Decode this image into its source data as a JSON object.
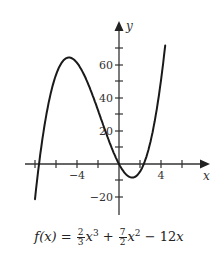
{
  "chart_data": {
    "type": "line",
    "title": "",
    "function": "f(x) = (2/3)x^3 + (7/2)x^2 - 12x",
    "caption": "f(x) = 2/3 x^3 + 7/2 x^2 − 12x",
    "xlabel": "x",
    "ylabel": "y",
    "xlim": [
      -9.5,
      8.5
    ],
    "ylim": [
      -25,
      85
    ],
    "x_ticks": [
      -8,
      -6,
      -4,
      -2,
      2,
      4,
      6
    ],
    "x_tick_labels": [
      {
        "value": -4,
        "label": "−4"
      },
      {
        "value": 4,
        "label": "4"
      }
    ],
    "y_ticks": [
      -20,
      -10,
      10,
      20,
      30,
      40,
      50,
      60,
      70
    ],
    "y_tick_labels": [
      {
        "value": -20,
        "label": "−20"
      },
      {
        "value": 20,
        "label": "20"
      },
      {
        "value": 40,
        "label": "40"
      },
      {
        "value": 60,
        "label": "60"
      }
    ],
    "grid": false,
    "series": [
      {
        "name": "f(x)",
        "x": [
          -8,
          -7.5,
          -7,
          -6.5,
          -6,
          -5.5,
          -5,
          -4.5,
          -4,
          -3.5,
          -3,
          -2.5,
          -2,
          -1.5,
          -1,
          -0.5,
          0,
          0.5,
          1,
          1.5,
          2,
          2.5,
          3,
          3.5,
          4,
          4.4
        ],
        "values": [
          -21.33,
          3.94,
          24.17,
          39.77,
          54,
          62.79,
          62.92,
          64.13,
          61.33,
          55.04,
          45.5,
          32.71,
          26.67,
          15.62,
          3.83,
          2.79,
          0,
          -4.04,
          -7.83,
          -10.0,
          -6.67,
          -0.23,
          13.5,
          26.29,
          52,
          71.79
        ]
      }
    ],
    "notable_points": {
      "local_max": {
        "x": -4.5,
        "y": 64.1
      },
      "local_min": {
        "x": 1,
        "y": -7.8
      },
      "roots": [
        -7.6,
        0,
        1.9
      ]
    }
  },
  "labels": {
    "x_axis": "x",
    "y_axis": "y",
    "tick_neg4": "−4",
    "tick_4": "4",
    "tick_60": "60",
    "tick_40": "40",
    "tick_20": "20",
    "tick_neg20": "−20"
  },
  "formula": {
    "lhs": "f(x) = ",
    "c1_num": "2",
    "c1_den": "3",
    "t1": "x",
    "e1": "3",
    "plus": " + ",
    "c2_num": "7",
    "c2_den": "2",
    "t2": "x",
    "e2": "2",
    "minus": " − 12",
    "t3": "x"
  },
  "colors": {
    "curve": "#1a1a1a",
    "axis": "#333333"
  }
}
